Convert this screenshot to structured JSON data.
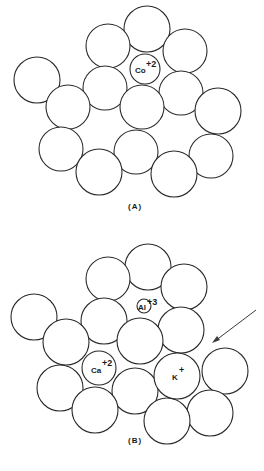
{
  "figure": {
    "panels": [
      {
        "id": "A",
        "label": "(A)",
        "ions": [
          {
            "symbol": "Co",
            "charge": "+2"
          }
        ]
      },
      {
        "id": "B",
        "label": "(B)",
        "ions": [
          {
            "symbol": "Al",
            "charge": "+3"
          },
          {
            "symbol": "Ca",
            "charge": "+2"
          },
          {
            "symbol": "K",
            "charge": "+"
          }
        ],
        "annotations": [
          "arrow pointing to gap near K+"
        ]
      }
    ]
  }
}
